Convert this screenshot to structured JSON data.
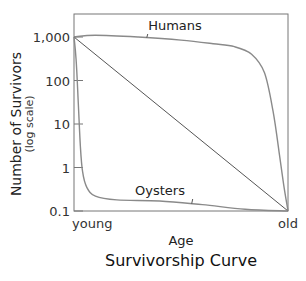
{
  "chart_data": {
    "type": "line",
    "title": "Survivorship Curve",
    "xlabel": "Age",
    "ylabel": "Number of Survivors",
    "ylabel_sub": "(log scale)",
    "yscale": "log",
    "ylim": [
      0.1,
      1000
    ],
    "xlim": [
      0,
      1
    ],
    "y_ticks": [
      1000,
      100,
      10,
      1,
      0.1
    ],
    "y_tick_labels": [
      "1,000",
      "100",
      "10",
      "1",
      "0.1"
    ],
    "x_tick_labels": [
      {
        "x": 0,
        "label": "young"
      },
      {
        "x": 1,
        "label": "old"
      }
    ],
    "grid": false,
    "series": [
      {
        "name": "Humans",
        "x": [
          0,
          0.1,
          0.3,
          0.5,
          0.65,
          0.75,
          0.83,
          0.89,
          0.93,
          0.96,
          0.98,
          1.0
        ],
        "y": [
          1000,
          1100,
          1000,
          850,
          700,
          600,
          400,
          150,
          20,
          2,
          0.4,
          0.1
        ]
      },
      {
        "name": "Diagonal",
        "x": [
          0,
          1
        ],
        "y": [
          1000,
          0.1
        ]
      },
      {
        "name": "Oysters",
        "x": [
          0,
          0.01,
          0.02,
          0.03,
          0.04,
          0.06,
          0.1,
          0.2,
          0.4,
          0.6,
          0.8,
          1.0
        ],
        "y": [
          1000,
          300,
          30,
          3,
          0.8,
          0.35,
          0.22,
          0.18,
          0.17,
          0.14,
          0.11,
          0.1
        ]
      }
    ],
    "annotations": [
      {
        "text": "Humans",
        "series": "Humans",
        "x": 0.34
      },
      {
        "text": "Oysters",
        "series": "Oysters",
        "x": 0.55
      }
    ]
  }
}
